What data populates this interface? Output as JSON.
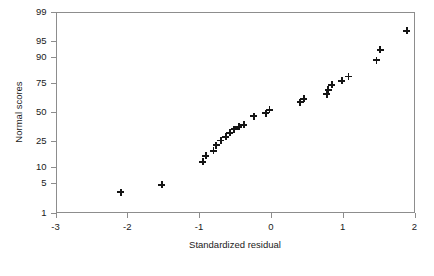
{
  "chart_data": {
    "type": "scatter",
    "title": "",
    "xlabel": "Standardized residual",
    "ylabel": "Normal scores",
    "xlim": [
      -3,
      2
    ],
    "ylim_percentile": [
      1,
      99
    ],
    "grid": false,
    "legend": null,
    "marker": "plus",
    "marker_color": "#151515",
    "x_ticks": [
      -3,
      -2,
      -1,
      0,
      1,
      2
    ],
    "x_tick_labels": [
      "-3",
      "-2",
      "-1",
      "0",
      "1",
      "2"
    ],
    "y_ticks": [
      1,
      5,
      10,
      25,
      50,
      75,
      90,
      95,
      99
    ],
    "y_tick_labels": [
      "1",
      "5",
      "10",
      "25",
      "50",
      "75",
      "90",
      "95",
      "99"
    ],
    "points": [
      {
        "x": -2.09,
        "y": 3.2
      },
      {
        "x": -1.52,
        "y": 4.6
      },
      {
        "x": -0.95,
        "y": 12.5
      },
      {
        "x": -0.91,
        "y": 15.5
      },
      {
        "x": -0.8,
        "y": 18.5
      },
      {
        "x": -0.76,
        "y": 22.0
      },
      {
        "x": -0.7,
        "y": 25.5
      },
      {
        "x": -0.63,
        "y": 28.5
      },
      {
        "x": -0.57,
        "y": 31.5
      },
      {
        "x": -0.51,
        "y": 34.5
      },
      {
        "x": -0.45,
        "y": 36.5
      },
      {
        "x": -0.38,
        "y": 38.5
      },
      {
        "x": -0.24,
        "y": 46.0
      },
      {
        "x": -0.07,
        "y": 49.0
      },
      {
        "x": -0.02,
        "y": 52.0
      },
      {
        "x": 0.41,
        "y": 59.0
      },
      {
        "x": 0.46,
        "y": 62.0
      },
      {
        "x": 0.78,
        "y": 66.0
      },
      {
        "x": 0.8,
        "y": 69.5
      },
      {
        "x": 0.85,
        "y": 73.5
      },
      {
        "x": 0.99,
        "y": 76.5
      },
      {
        "x": 1.08,
        "y": 79.5
      },
      {
        "x": 1.47,
        "y": 88.5
      },
      {
        "x": 1.52,
        "y": 92.5
      },
      {
        "x": 1.89,
        "y": 97.0
      }
    ]
  }
}
